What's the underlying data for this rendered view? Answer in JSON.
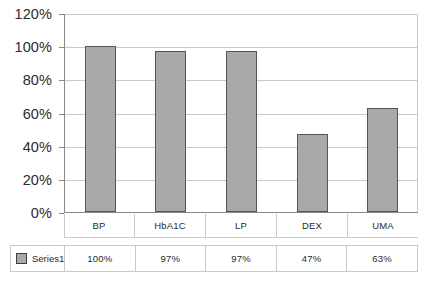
{
  "chart_data": {
    "type": "bar",
    "title": "",
    "xlabel": "",
    "ylabel": "",
    "categories": [
      "BP",
      "HbA1C",
      "LP",
      "DEX",
      "UMA"
    ],
    "values": [
      100,
      97,
      97,
      47,
      63
    ],
    "value_labels": [
      "100%",
      "97%",
      "97%",
      "47%",
      "63%"
    ],
    "series": [
      {
        "name": "Series1",
        "values": [
          100,
          97,
          97,
          47,
          63
        ]
      }
    ],
    "ylim": [
      0,
      120
    ],
    "y_ticks": [
      0,
      20,
      40,
      60,
      80,
      100,
      120
    ],
    "y_tick_labels": [
      "0%",
      "20%",
      "40%",
      "60%",
      "80%",
      "100%",
      "120%"
    ],
    "grid": true,
    "legend_position": "bottom-data-table",
    "data_table_visible": true,
    "colors": {
      "bar_fill": "#a9a9a9",
      "bar_border": "#555555",
      "gridline": "#c9c9c9",
      "axis": "#8a8a8a",
      "text": "#2b2b2b",
      "background": "#ffffff"
    }
  },
  "legend": {
    "series_label": "Series1",
    "swatch_icon": "legend-swatch-icon"
  }
}
